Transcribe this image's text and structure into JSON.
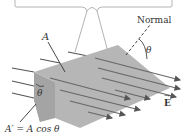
{
  "diagram": {
    "labels": {
      "normal": "Normal",
      "area": "A",
      "theta_top": "θ",
      "theta_side": "θ",
      "projected_area": "A′ = A cos θ",
      "field": "E",
      "field_arrow": "→"
    },
    "colors": {
      "surface_top": "#b3b3b3",
      "surface_side": "#9e9e9e",
      "field_lines": "#555555",
      "bubble_stroke": "#aaaaaa",
      "text": "#333333"
    },
    "field_line_count": 12
  }
}
